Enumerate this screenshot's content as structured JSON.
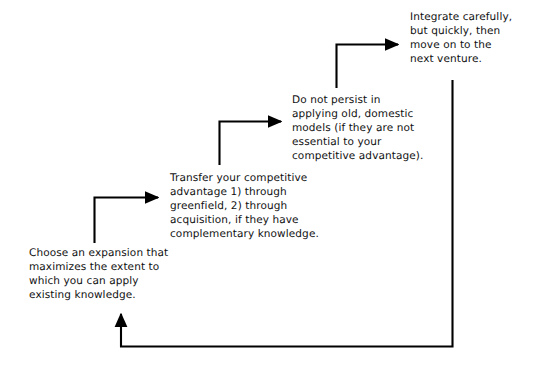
{
  "diagram": {
    "line_color": "#000000",
    "text_color": "#111111",
    "background_color": "#ffffff",
    "steps": [
      {
        "id": "step-1",
        "order": 1,
        "text": "Choose an expansion that\nmaximizes the extent to\nwhich you can apply\nexisting knowledge."
      },
      {
        "id": "step-2",
        "order": 2,
        "text": "Transfer your competitive\nadvantage 1) through\ngreenfield, 2) through\nacquisition, if they have\ncomplementary knowledge."
      },
      {
        "id": "step-3",
        "order": 3,
        "text": "Do not persist in\napplying old, domestic\nmodels (if they are not\nessential to your\ncompetitive advantage)."
      },
      {
        "id": "step-4",
        "order": 4,
        "text": "Integrate carefully,\nbut quickly, then\nmove on to the\nnext venture."
      }
    ],
    "connectors": [
      {
        "id": "connector-1-to-2",
        "from": "step-1",
        "to": "step-2",
        "shape": "elbow-up-right"
      },
      {
        "id": "connector-2-to-3",
        "from": "step-2",
        "to": "step-3",
        "shape": "elbow-up-right"
      },
      {
        "id": "connector-3-to-4",
        "from": "step-3",
        "to": "step-4",
        "shape": "elbow-up-right"
      },
      {
        "id": "connector-feedback-loop",
        "from": "step-4",
        "to": "step-1",
        "shape": "loop-down-left-up"
      }
    ]
  }
}
